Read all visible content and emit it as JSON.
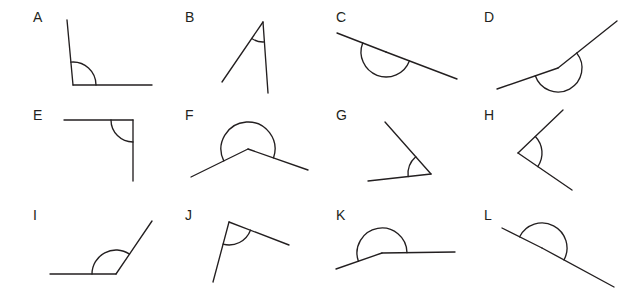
{
  "worksheet": {
    "title": "Angles identification figure set",
    "background_color": "#ffffff",
    "stroke_color": "#231f20",
    "label_font_size": 14,
    "rows": 3,
    "columns": 4,
    "figure_count": 12
  },
  "figures": [
    {
      "id": "A",
      "label": "A",
      "label_x": 33,
      "label_y": 10,
      "angle_type": "obtuse",
      "arc_style": "single",
      "vertex": {
        "x": 73,
        "y": 85
      },
      "arm1_end": {
        "x": 67,
        "y": 20
      },
      "arm2_end": {
        "x": 152,
        "y": 85
      },
      "arc_radius": 23,
      "arc_sweep": 1
    },
    {
      "id": "B",
      "label": "B",
      "label_x": 185,
      "label_y": 10,
      "angle_type": "acute",
      "arc_style": "single",
      "vertex": {
        "x": 263,
        "y": 22
      },
      "arm1_end": {
        "x": 222,
        "y": 82
      },
      "arm2_end": {
        "x": 268,
        "y": 93
      },
      "arc_radius": 20,
      "arc_sweep": 1
    },
    {
      "id": "C",
      "label": "C",
      "label_x": 336,
      "label_y": 10,
      "angle_type": "straight",
      "arc_style": "single",
      "vertex": {
        "x": 386,
        "y": 52
      },
      "arm1_end": {
        "x": 337,
        "y": 33
      },
      "arm2_end": {
        "x": 457,
        "y": 79
      },
      "arc_radius": 25,
      "arc_sweep": 1
    },
    {
      "id": "D",
      "label": "D",
      "label_x": 484,
      "label_y": 10,
      "angle_type": "reflex",
      "arc_style": "single",
      "vertex": {
        "x": 558,
        "y": 68
      },
      "arm1_end": {
        "x": 497,
        "y": 89
      },
      "arm2_end": {
        "x": 617,
        "y": 21
      },
      "arc_radius": 24,
      "arc_sweep": 1
    },
    {
      "id": "E",
      "label": "E",
      "label_x": 33,
      "label_y": 108,
      "angle_type": "right",
      "arc_style": "single",
      "vertex": {
        "x": 133,
        "y": 120
      },
      "arm1_end": {
        "x": 64,
        "y": 120
      },
      "arm2_end": {
        "x": 133,
        "y": 181
      },
      "arc_radius": 22,
      "arc_sweep": 1
    },
    {
      "id": "F",
      "label": "F",
      "label_x": 185,
      "label_y": 108,
      "angle_type": "reflex",
      "arc_style": "single",
      "vertex": {
        "x": 248,
        "y": 149
      },
      "arm1_end": {
        "x": 191,
        "y": 177
      },
      "arm2_end": {
        "x": 308,
        "y": 170
      },
      "arc_radius": 27,
      "arc_sweep": 1
    },
    {
      "id": "G",
      "label": "G",
      "label_x": 336,
      "label_y": 108,
      "angle_type": "acute",
      "arc_style": "single",
      "vertex": {
        "x": 431,
        "y": 174
      },
      "arm1_end": {
        "x": 385,
        "y": 122
      },
      "arm2_end": {
        "x": 368,
        "y": 181
      },
      "arc_radius": 23,
      "arc_sweep": 1
    },
    {
      "id": "H",
      "label": "H",
      "label_x": 484,
      "label_y": 108,
      "angle_type": "acute",
      "arc_style": "single",
      "vertex": {
        "x": 518,
        "y": 153
      },
      "arm1_end": {
        "x": 563,
        "y": 110
      },
      "arm2_end": {
        "x": 572,
        "y": 190
      },
      "arc_radius": 24,
      "arc_sweep": 1
    },
    {
      "id": "I",
      "label": "I",
      "label_x": 33,
      "label_y": 208,
      "angle_type": "obtuse",
      "arc_style": "single",
      "vertex": {
        "x": 116,
        "y": 274
      },
      "arm1_end": {
        "x": 50,
        "y": 274
      },
      "arm2_end": {
        "x": 152,
        "y": 221
      },
      "arc_radius": 24,
      "arc_sweep": 1
    },
    {
      "id": "J",
      "label": "J",
      "label_x": 185,
      "label_y": 208,
      "angle_type": "acute",
      "arc_style": "single",
      "vertex": {
        "x": 229,
        "y": 222
      },
      "arm1_end": {
        "x": 213,
        "y": 282
      },
      "arm2_end": {
        "x": 289,
        "y": 245
      },
      "arc_radius": 23,
      "arc_sweep": 1
    },
    {
      "id": "K",
      "label": "K",
      "label_x": 336,
      "label_y": 208,
      "angle_type": "reflex",
      "arc_style": "single",
      "vertex": {
        "x": 382,
        "y": 253
      },
      "arm1_end": {
        "x": 336,
        "y": 269
      },
      "arm2_end": {
        "x": 455,
        "y": 252
      },
      "arc_radius": 25,
      "arc_sweep": 1
    },
    {
      "id": "L",
      "label": "L",
      "label_x": 484,
      "label_y": 208,
      "angle_type": "straight",
      "arc_style": "single",
      "vertex": {
        "x": 542,
        "y": 248
      },
      "arm1_end": {
        "x": 502,
        "y": 228
      },
      "arm2_end": {
        "x": 614,
        "y": 287
      },
      "arc_radius": 25,
      "arc_sweep": 1
    }
  ]
}
